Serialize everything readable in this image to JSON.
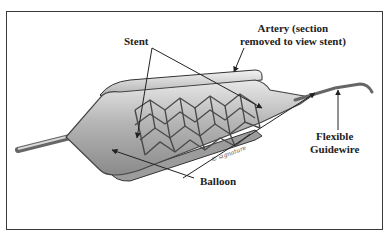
{
  "figure": {
    "labels": {
      "stent": "Stent",
      "artery_line1": "Artery (section",
      "artery_line2": "removed to view stent)",
      "guidewire_line1": "Flexible",
      "guidewire_line2": "Guidewire",
      "balloon": "Balloon"
    },
    "signature": "© artist signature"
  },
  "colors": {
    "frame": "#3a3a3a",
    "ink": "#222222",
    "balloon_fill": "#bdbdbd",
    "mesh": "#555555"
  }
}
